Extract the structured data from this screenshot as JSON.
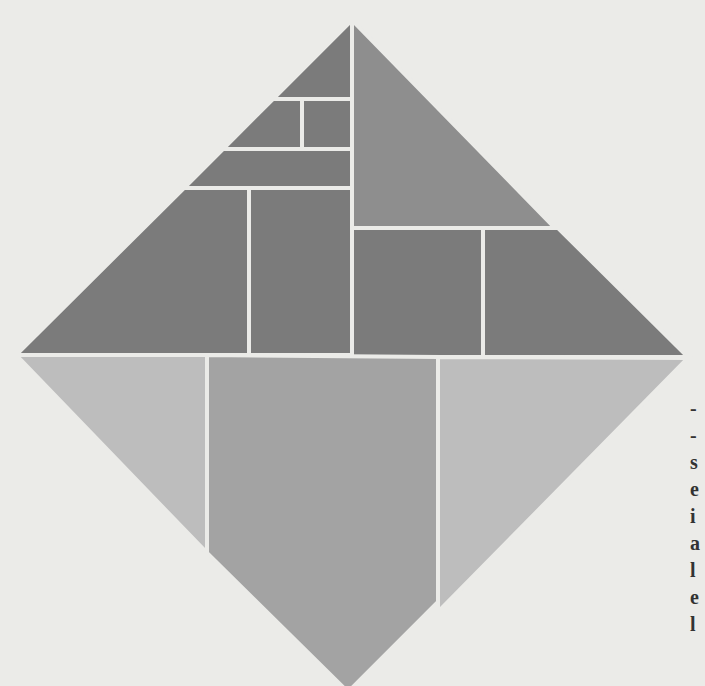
{
  "figure": {
    "colors": {
      "background": "#ebebe8",
      "dark": "#7b7b7b",
      "upper_right_triangle": "#8e8e8e",
      "lower_mid": "#a3a3a3",
      "lower_side": "#bdbdbd",
      "gap": "#ebebe8"
    },
    "vertices": {
      "top": [
        352,
        20
      ],
      "left": [
        16,
        355
      ],
      "right": [
        688,
        358
      ],
      "bottom": [
        348,
        692
      ]
    }
  },
  "edge_text": {
    "fragments": [
      "-",
      "-",
      "s",
      "e",
      "i",
      "a",
      "l",
      "e",
      "l"
    ]
  }
}
